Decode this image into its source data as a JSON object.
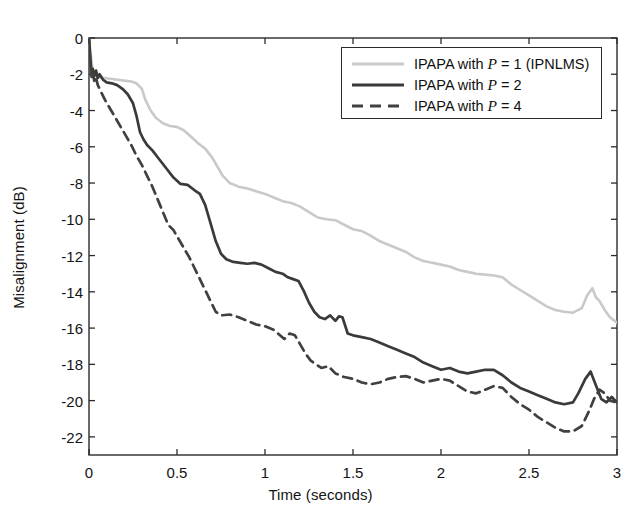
{
  "chart_data": {
    "type": "line",
    "title": "",
    "xlabel": "Time (seconds)",
    "ylabel": "Misalignment (dB)",
    "xlim": [
      0,
      3
    ],
    "ylim": [
      -23,
      0
    ],
    "xticks": [
      0,
      0.5,
      1,
      1.5,
      2,
      2.5,
      3
    ],
    "xtick_labels": [
      "0",
      "0.5",
      "1",
      "1.5",
      "2",
      "2.5",
      "3"
    ],
    "yticks": [
      0,
      -2,
      -4,
      -6,
      -8,
      -10,
      -12,
      -14,
      -16,
      -18,
      -20,
      -22
    ],
    "ytick_labels": [
      "0",
      "-2",
      "-4",
      "-6",
      "-8",
      "-10",
      "-12",
      "-14",
      "-16",
      "-18",
      "-20",
      "-22"
    ],
    "grid": false,
    "legend_position": "top-right",
    "series": [
      {
        "name": "IPAPA with P = 1 (IPNLMS)",
        "label_prefix": "IPAPA with ",
        "label_var": "P",
        "label_suffix": " = 1 (IPNLMS)",
        "color": "#c9c9c9",
        "style": "solid",
        "width": 2.6,
        "x": [
          0,
          0.01,
          0.02,
          0.03,
          0.05,
          0.08,
          0.12,
          0.16,
          0.2,
          0.24,
          0.27,
          0.3,
          0.32,
          0.35,
          0.38,
          0.42,
          0.46,
          0.5,
          0.54,
          0.58,
          0.62,
          0.66,
          0.7,
          0.73,
          0.76,
          0.8,
          0.85,
          0.9,
          0.95,
          1.0,
          1.05,
          1.1,
          1.15,
          1.2,
          1.25,
          1.3,
          1.35,
          1.4,
          1.45,
          1.5,
          1.55,
          1.6,
          1.65,
          1.7,
          1.75,
          1.8,
          1.85,
          1.9,
          1.95,
          2.0,
          2.05,
          2.1,
          2.15,
          2.2,
          2.25,
          2.3,
          2.35,
          2.4,
          2.45,
          2.5,
          2.55,
          2.6,
          2.65,
          2.7,
          2.75,
          2.8,
          2.83,
          2.86,
          2.88,
          2.9,
          2.93,
          2.96,
          3.0
        ],
        "y": [
          0,
          -0.9,
          -1.7,
          -2.0,
          -2.15,
          -2.2,
          -2.25,
          -2.3,
          -2.35,
          -2.4,
          -2.5,
          -2.8,
          -3.4,
          -4.0,
          -4.4,
          -4.7,
          -4.85,
          -4.9,
          -5.1,
          -5.45,
          -5.8,
          -6.1,
          -6.6,
          -7.1,
          -7.6,
          -8.0,
          -8.2,
          -8.3,
          -8.45,
          -8.6,
          -8.8,
          -9.0,
          -9.1,
          -9.3,
          -9.6,
          -9.9,
          -10.0,
          -10.05,
          -10.3,
          -10.55,
          -10.65,
          -10.9,
          -11.2,
          -11.4,
          -11.6,
          -11.8,
          -12.1,
          -12.3,
          -12.4,
          -12.5,
          -12.6,
          -12.8,
          -12.9,
          -13.0,
          -13.05,
          -13.1,
          -13.2,
          -13.6,
          -13.9,
          -14.2,
          -14.5,
          -14.8,
          -15.0,
          -15.1,
          -15.15,
          -14.9,
          -14.2,
          -13.8,
          -14.3,
          -14.5,
          -15.0,
          -15.4,
          -15.7
        ],
        "legend_line": "solid"
      },
      {
        "name": "IPAPA with P = 2",
        "label_prefix": "IPAPA with ",
        "label_var": "P",
        "label_suffix": " = 2",
        "color": "#3a3a3a",
        "style": "solid",
        "width": 2.7,
        "x": [
          0,
          0.008,
          0.015,
          0.022,
          0.03,
          0.04,
          0.05,
          0.06,
          0.08,
          0.1,
          0.13,
          0.16,
          0.19,
          0.22,
          0.25,
          0.27,
          0.29,
          0.31,
          0.33,
          0.36,
          0.4,
          0.44,
          0.48,
          0.52,
          0.56,
          0.6,
          0.63,
          0.66,
          0.69,
          0.72,
          0.75,
          0.78,
          0.82,
          0.86,
          0.9,
          0.94,
          0.98,
          1.02,
          1.06,
          1.1,
          1.13,
          1.16,
          1.19,
          1.22,
          1.25,
          1.28,
          1.31,
          1.34,
          1.37,
          1.4,
          1.42,
          1.44,
          1.47,
          1.5,
          1.55,
          1.6,
          1.65,
          1.7,
          1.75,
          1.8,
          1.85,
          1.9,
          1.95,
          2.0,
          2.05,
          2.1,
          2.15,
          2.2,
          2.25,
          2.3,
          2.35,
          2.4,
          2.45,
          2.5,
          2.55,
          2.6,
          2.65,
          2.7,
          2.75,
          2.78,
          2.82,
          2.85,
          2.87,
          2.89,
          2.91,
          2.94,
          2.97,
          3.0
        ],
        "y": [
          0,
          -1.2,
          -2.0,
          -1.7,
          -2.1,
          -1.8,
          -2.2,
          -2.0,
          -2.3,
          -2.45,
          -2.5,
          -2.6,
          -2.8,
          -3.1,
          -3.6,
          -4.3,
          -5.2,
          -5.6,
          -5.9,
          -6.2,
          -6.7,
          -7.2,
          -7.7,
          -8.05,
          -8.1,
          -8.4,
          -8.6,
          -9.2,
          -10.2,
          -11.2,
          -11.9,
          -12.2,
          -12.35,
          -12.4,
          -12.45,
          -12.4,
          -12.5,
          -12.7,
          -12.9,
          -13.0,
          -13.2,
          -13.3,
          -13.4,
          -13.95,
          -14.6,
          -15.1,
          -15.4,
          -15.5,
          -15.3,
          -15.6,
          -15.35,
          -15.4,
          -16.3,
          -16.4,
          -16.5,
          -16.6,
          -16.8,
          -17.0,
          -17.2,
          -17.4,
          -17.6,
          -17.9,
          -18.1,
          -18.3,
          -18.2,
          -18.4,
          -18.5,
          -18.4,
          -18.3,
          -18.3,
          -18.6,
          -19.0,
          -19.3,
          -19.5,
          -19.7,
          -19.9,
          -20.1,
          -20.2,
          -20.1,
          -19.6,
          -18.8,
          -18.4,
          -18.9,
          -19.4,
          -19.9,
          -20.1,
          -19.8,
          -20.1
        ],
        "legend_line": "solid"
      },
      {
        "name": "IPAPA with P = 4",
        "label_prefix": "IPAPA with ",
        "label_var": "P",
        "label_suffix": " = 4",
        "color": "#404040",
        "style": "dashed",
        "width": 2.7,
        "dash": "9,6",
        "x": [
          0,
          0.008,
          0.015,
          0.022,
          0.03,
          0.04,
          0.05,
          0.07,
          0.09,
          0.12,
          0.15,
          0.18,
          0.21,
          0.24,
          0.27,
          0.3,
          0.33,
          0.36,
          0.39,
          0.42,
          0.45,
          0.48,
          0.51,
          0.54,
          0.57,
          0.6,
          0.63,
          0.66,
          0.69,
          0.72,
          0.75,
          0.8,
          0.85,
          0.9,
          0.95,
          1.0,
          1.05,
          1.08,
          1.11,
          1.14,
          1.17,
          1.2,
          1.23,
          1.26,
          1.29,
          1.32,
          1.36,
          1.4,
          1.45,
          1.5,
          1.55,
          1.6,
          1.65,
          1.7,
          1.75,
          1.8,
          1.85,
          1.9,
          1.95,
          2.0,
          2.05,
          2.1,
          2.15,
          2.2,
          2.25,
          2.3,
          2.35,
          2.4,
          2.45,
          2.5,
          2.55,
          2.6,
          2.65,
          2.7,
          2.75,
          2.8,
          2.84,
          2.87,
          2.9,
          2.93,
          2.96,
          3.0
        ],
        "y": [
          0,
          -1.4,
          -2.2,
          -1.9,
          -2.4,
          -2.2,
          -2.6,
          -3.0,
          -3.4,
          -3.9,
          -4.4,
          -4.9,
          -5.4,
          -5.9,
          -6.5,
          -7.0,
          -7.6,
          -8.2,
          -8.9,
          -9.6,
          -10.3,
          -10.6,
          -11.1,
          -11.6,
          -12.1,
          -12.7,
          -13.3,
          -13.9,
          -14.5,
          -15.1,
          -15.3,
          -15.25,
          -15.4,
          -15.6,
          -15.8,
          -15.9,
          -16.1,
          -16.35,
          -16.6,
          -16.3,
          -16.4,
          -16.9,
          -17.4,
          -17.8,
          -18.0,
          -18.2,
          -18.1,
          -18.5,
          -18.7,
          -18.8,
          -19.0,
          -19.1,
          -19.0,
          -18.8,
          -18.7,
          -18.65,
          -18.8,
          -19.0,
          -18.9,
          -18.8,
          -18.9,
          -19.2,
          -19.5,
          -19.6,
          -19.4,
          -19.2,
          -19.3,
          -19.8,
          -20.2,
          -20.5,
          -20.9,
          -21.2,
          -21.5,
          -21.7,
          -21.7,
          -21.4,
          -20.6,
          -19.9,
          -19.4,
          -19.6,
          -20.0,
          -20.1
        ],
        "legend_line": "dashed"
      }
    ]
  },
  "legend": {
    "items": [
      {
        "text_prefix": "IPAPA with ",
        "var": "P",
        "text_suffix": " = 1 (IPNLMS)"
      },
      {
        "text_prefix": "IPAPA with ",
        "var": "P",
        "text_suffix": " = 2"
      },
      {
        "text_prefix": "IPAPA with ",
        "var": "P",
        "text_suffix": " = 4"
      }
    ]
  },
  "colors": {
    "axis": "#2b2b2b",
    "series_1": "#c9c9c9",
    "series_2": "#3a3a3a",
    "series_3": "#404040",
    "background": "#ffffff"
  }
}
